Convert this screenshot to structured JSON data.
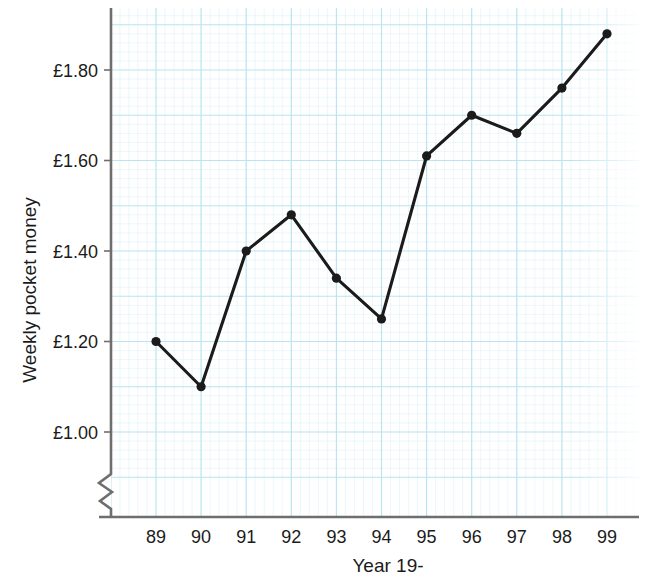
{
  "chart_data": {
    "type": "line",
    "title": "",
    "xlabel": "Year 19-",
    "ylabel": "Weekly pocket money",
    "categories": [
      "89",
      "90",
      "91",
      "92",
      "93",
      "94",
      "95",
      "96",
      "97",
      "98",
      "99"
    ],
    "values": [
      1.2,
      1.1,
      1.4,
      1.48,
      1.34,
      1.25,
      1.61,
      1.7,
      1.66,
      1.76,
      1.88
    ],
    "value_prefix": "£",
    "ytick_labels": [
      "£1.00",
      "£1.20",
      "£1.40",
      "£1.60",
      "£1.80"
    ],
    "ytick_values": [
      1.0,
      1.2,
      1.4,
      1.6,
      1.8
    ],
    "ylim": [
      0.98,
      1.9
    ],
    "xlim": [
      "88.4",
      "99.6"
    ],
    "grid": true,
    "grid_major_step": 0.1,
    "grid_minor_per_major": 5,
    "axis_break": true,
    "legend": "none",
    "series_name": "Weekly pocket money",
    "marker": "filled-circle",
    "colors": {
      "line": "#1b1b1b",
      "marker": "#1b1b1b",
      "grid_major": "#b6e3ef",
      "grid_minor": "#ddf2f7",
      "axis": "#6e6e6e",
      "text": "#1b1b1b",
      "background": "#ffffff"
    }
  }
}
